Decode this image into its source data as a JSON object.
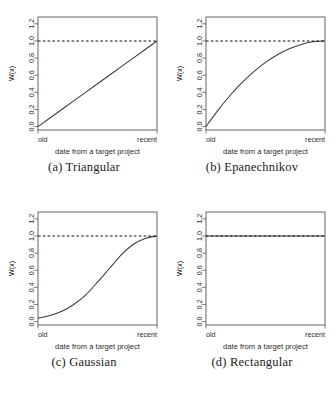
{
  "figure": {
    "layout": "2x2-grid",
    "panels": [
      {
        "caption": "(a) Triangular",
        "caption_key": "a",
        "kernel": "triangular"
      },
      {
        "caption": "(b) Epanechnikov",
        "caption_key": "b",
        "kernel": "epanechnikov"
      },
      {
        "caption": "(c) Gaussian",
        "caption_key": "c",
        "kernel": "gaussian"
      },
      {
        "caption": "(d) Rectangular",
        "caption_key": "d",
        "kernel": "rectangular"
      }
    ]
  },
  "axes": {
    "ylabel": "W(x)",
    "xlabel": "date from a target project",
    "ytick_labels": [
      "0.0",
      "0.2",
      "0.4",
      "0.6",
      "0.8",
      "1.0",
      "1.2"
    ],
    "ytick_values": [
      0.0,
      0.2,
      0.4,
      0.6,
      0.8,
      1.0,
      1.2
    ],
    "xtick_labels": [
      "old",
      "recent"
    ],
    "ylim": [
      -0.04,
      1.28
    ],
    "xlim": [
      0,
      1
    ],
    "reference_line_y": 1.0,
    "grid": false
  },
  "colors": {
    "curve": "#3b3b3b",
    "reference_line": "#111111",
    "box": "#555555",
    "text": "#2b2b2b",
    "background": "#ffffff"
  },
  "chart_data": [
    {
      "type": "line",
      "title": "(a) Triangular",
      "xlabel": "date from a target project",
      "ylabel": "W(x)",
      "xlim": [
        0,
        1
      ],
      "ylim": [
        -0.04,
        1.28
      ],
      "xtick_labels": [
        "old",
        "recent"
      ],
      "ytick_labels": [
        "0.0",
        "0.2",
        "0.4",
        "0.6",
        "0.8",
        "1.0",
        "1.2"
      ],
      "grid": false,
      "legend": null,
      "series": [
        {
          "name": "Triangular kernel weight",
          "x": [
            0.0,
            0.1,
            0.2,
            0.3,
            0.4,
            0.5,
            0.6,
            0.7,
            0.8,
            0.9,
            1.0
          ],
          "values": [
            0.0,
            0.1,
            0.2,
            0.3,
            0.4,
            0.5,
            0.6,
            0.7,
            0.8,
            0.9,
            1.0
          ]
        },
        {
          "name": "reference line y=1.0",
          "style": "dashed",
          "x": [
            0.0,
            1.0
          ],
          "values": [
            1.0,
            1.0
          ]
        }
      ]
    },
    {
      "type": "line",
      "title": "(b) Epanechnikov",
      "xlabel": "date from a target project",
      "ylabel": "W(x)",
      "xlim": [
        0,
        1
      ],
      "ylim": [
        -0.04,
        1.28
      ],
      "xtick_labels": [
        "old",
        "recent"
      ],
      "ytick_labels": [
        "0.0",
        "0.2",
        "0.4",
        "0.6",
        "0.8",
        "1.0",
        "1.2"
      ],
      "grid": false,
      "legend": null,
      "series": [
        {
          "name": "Epanechnikov kernel weight",
          "x": [
            0.0,
            0.1,
            0.2,
            0.3,
            0.4,
            0.5,
            0.6,
            0.7,
            0.8,
            0.9,
            1.0
          ],
          "values": [
            0.0,
            0.19,
            0.36,
            0.51,
            0.64,
            0.75,
            0.84,
            0.91,
            0.96,
            0.99,
            1.0
          ]
        },
        {
          "name": "reference line y=1.0",
          "style": "dashed",
          "x": [
            0.0,
            1.0
          ],
          "values": [
            1.0,
            1.0
          ]
        }
      ]
    },
    {
      "type": "line",
      "title": "(c) Gaussian",
      "xlabel": "date from a target project",
      "ylabel": "W(x)",
      "xlim": [
        0,
        1
      ],
      "ylim": [
        -0.04,
        1.28
      ],
      "xtick_labels": [
        "old",
        "recent"
      ],
      "ytick_labels": [
        "0.0",
        "0.2",
        "0.4",
        "0.6",
        "0.8",
        "1.0",
        "1.2"
      ],
      "grid": false,
      "legend": null,
      "series": [
        {
          "name": "Gaussian kernel weight",
          "x": [
            0.0,
            0.1,
            0.2,
            0.3,
            0.4,
            0.5,
            0.6,
            0.7,
            0.8,
            0.9,
            1.0
          ],
          "values": [
            0.04,
            0.07,
            0.12,
            0.2,
            0.31,
            0.46,
            0.62,
            0.78,
            0.9,
            0.97,
            1.0
          ]
        },
        {
          "name": "reference line y=1.0",
          "style": "dashed",
          "x": [
            0.0,
            1.0
          ],
          "values": [
            1.0,
            1.0
          ]
        }
      ]
    },
    {
      "type": "line",
      "title": "(d) Rectangular",
      "xlabel": "date from a target project",
      "ylabel": "W(x)",
      "xlim": [
        0,
        1
      ],
      "ylim": [
        -0.04,
        1.28
      ],
      "xtick_labels": [
        "old",
        "recent"
      ],
      "ytick_labels": [
        "0.0",
        "0.2",
        "0.4",
        "0.6",
        "0.8",
        "1.0",
        "1.2"
      ],
      "grid": false,
      "legend": null,
      "series": [
        {
          "name": "Rectangular kernel weight",
          "x": [
            0.0,
            0.1,
            0.2,
            0.3,
            0.4,
            0.5,
            0.6,
            0.7,
            0.8,
            0.9,
            1.0
          ],
          "values": [
            1.0,
            1.0,
            1.0,
            1.0,
            1.0,
            1.0,
            1.0,
            1.0,
            1.0,
            1.0,
            1.0
          ]
        },
        {
          "name": "reference line y=1.0",
          "style": "dashed",
          "x": [
            0.0,
            1.0
          ],
          "values": [
            1.0,
            1.0
          ]
        }
      ]
    }
  ]
}
